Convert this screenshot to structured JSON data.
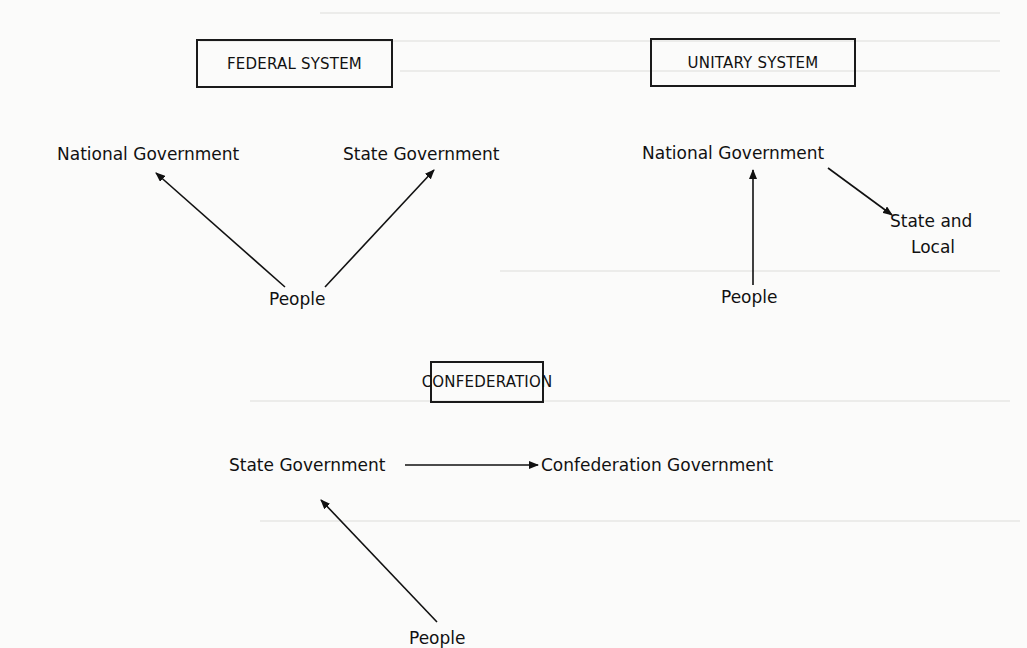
{
  "diagrams": {
    "federal": {
      "title": "FEDERAL SYSTEM",
      "nodes": {
        "national": "National Government",
        "state": "State Government",
        "people": "People"
      },
      "edges": [
        {
          "from": "People",
          "to": "National Government"
        },
        {
          "from": "People",
          "to": "State Government"
        }
      ]
    },
    "unitary": {
      "title": "UNITARY SYSTEM",
      "nodes": {
        "national": "National Government",
        "state_local_1": "State and",
        "state_local_2": "Local",
        "people": "People"
      },
      "edges": [
        {
          "from": "People",
          "to": "National Government"
        },
        {
          "from": "National Government",
          "to": "State and Local"
        }
      ]
    },
    "confederation": {
      "title": "CONFEDERATION",
      "nodes": {
        "state": "State Government",
        "confed": "Confederation Government",
        "people": "People"
      },
      "edges": [
        {
          "from": "People",
          "to": "State Government"
        },
        {
          "from": "State Government",
          "to": "Confederation Government"
        }
      ]
    }
  }
}
